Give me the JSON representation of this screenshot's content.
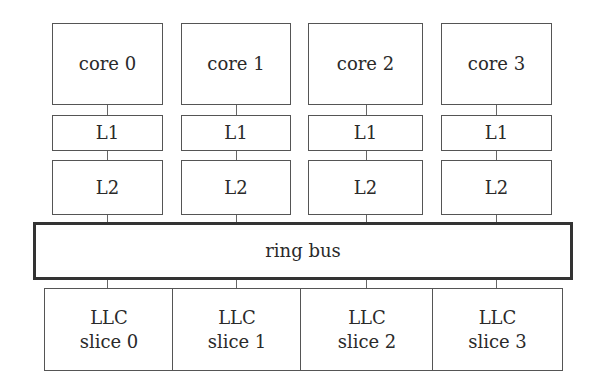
{
  "diagram": {
    "cores": [
      {
        "core": "core 0",
        "l1": "L1",
        "l2": "L2"
      },
      {
        "core": "core 1",
        "l1": "L1",
        "l2": "L2"
      },
      {
        "core": "core 2",
        "l1": "L1",
        "l2": "L2"
      },
      {
        "core": "core 3",
        "l1": "L1",
        "l2": "L2"
      }
    ],
    "interconnect": "ring bus",
    "llc_slices": [
      {
        "line1": "LLC",
        "line2": "slice 0"
      },
      {
        "line1": "LLC",
        "line2": "slice 1"
      },
      {
        "line1": "LLC",
        "line2": "slice 2"
      },
      {
        "line1": "LLC",
        "line2": "slice 3"
      }
    ]
  }
}
